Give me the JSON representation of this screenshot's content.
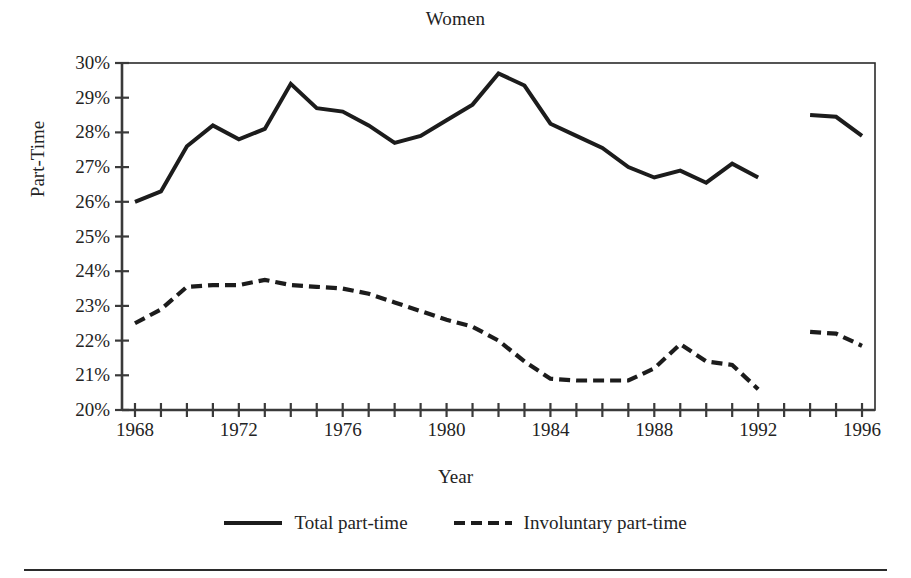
{
  "chart_data": {
    "type": "line",
    "title": "Women",
    "xlabel": "Year",
    "ylabel": "Part-Time",
    "grid": false,
    "legend_position": "bottom",
    "xlim": [
      1967.5,
      1996.5
    ],
    "ylim": [
      20,
      30
    ],
    "ytick_labels": [
      "30%",
      "29%",
      "28%",
      "27%",
      "26%",
      "25%",
      "24%",
      "23%",
      "22%",
      "21%",
      "20%"
    ],
    "ytick_values": [
      30,
      29,
      28,
      27,
      26,
      25,
      24,
      23,
      22,
      21,
      20
    ],
    "ytick_suffix": "%",
    "xtick_values": [
      1968,
      1969,
      1970,
      1971,
      1972,
      1973,
      1974,
      1975,
      1976,
      1977,
      1978,
      1979,
      1980,
      1981,
      1982,
      1983,
      1984,
      1985,
      1986,
      1987,
      1988,
      1989,
      1990,
      1991,
      1992,
      1993,
      1994,
      1995,
      1996
    ],
    "xtick_labels": [
      "1968",
      "1972",
      "1976",
      "1980",
      "1984",
      "1988",
      "1992",
      "1996"
    ],
    "xtick_labeled_values": [
      1968,
      1972,
      1976,
      1980,
      1984,
      1988,
      1992,
      1996
    ],
    "series": [
      {
        "name": "Total part-time",
        "style": "solid",
        "color": "#1c1c1c",
        "x": [
          1968,
          1969,
          1970,
          1971,
          1972,
          1973,
          1974,
          1975,
          1976,
          1977,
          1978,
          1979,
          1980,
          1981,
          1982,
          1983,
          1984,
          1985,
          1986,
          1987,
          1988,
          1989,
          1990,
          1991,
          1992
        ],
        "values": [
          26.0,
          26.3,
          27.6,
          28.2,
          27.8,
          28.1,
          29.4,
          28.7,
          28.6,
          28.2,
          27.7,
          27.9,
          28.35,
          28.8,
          29.7,
          29.35,
          28.25,
          27.9,
          27.55,
          27.0,
          26.7,
          26.9,
          26.55,
          27.1,
          26.7
        ]
      },
      {
        "name": "Total part-time",
        "style": "solid",
        "color": "#1c1c1c",
        "segment": "post-break",
        "x": [
          1994,
          1995,
          1996
        ],
        "values": [
          28.5,
          28.45,
          27.9
        ]
      },
      {
        "name": "Involuntary part-time",
        "style": "dashed",
        "color": "#1c1c1c",
        "x": [
          1968,
          1969,
          1970,
          1971,
          1972,
          1973,
          1974,
          1975,
          1976,
          1977,
          1978,
          1979,
          1980,
          1981,
          1982,
          1983,
          1984,
          1985,
          1986,
          1987,
          1988,
          1989,
          1990,
          1991,
          1992
        ],
        "values": [
          22.5,
          22.9,
          23.55,
          23.6,
          23.6,
          23.75,
          23.6,
          23.55,
          23.5,
          23.35,
          23.1,
          22.85,
          22.6,
          22.4,
          22.0,
          21.4,
          20.9,
          20.85,
          20.85,
          20.85,
          21.2,
          21.9,
          21.4,
          21.3,
          20.6
        ]
      },
      {
        "name": "Involuntary part-time",
        "style": "dashed",
        "color": "#1c1c1c",
        "segment": "post-break",
        "x": [
          1994,
          1995,
          1996
        ],
        "values": [
          22.25,
          22.2,
          21.85
        ]
      }
    ],
    "legend_entries": [
      {
        "label": "Total part-time",
        "style": "solid"
      },
      {
        "label": "Involuntary part-time",
        "style": "dashed"
      }
    ],
    "note": "Series are broken between 1992 and 1994 (no data plotted for 1993)."
  }
}
